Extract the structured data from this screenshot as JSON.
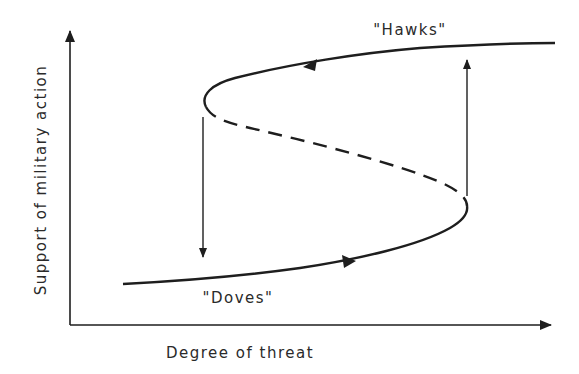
{
  "diagram": {
    "type": "catastrophe-fold-hysteresis",
    "x_axis_label": "Degree of threat",
    "y_axis_label": "Support of military action",
    "upper_branch_label": "\"Hawks\"",
    "lower_branch_label": "\"Doves\"",
    "colors": {
      "line": "#1e1e1e",
      "background": "#ffffff"
    },
    "branches": [
      {
        "name": "upper-stable",
        "style": "solid",
        "direction": "left"
      },
      {
        "name": "middle-unstable",
        "style": "dashed"
      },
      {
        "name": "lower-stable",
        "style": "solid",
        "direction": "right"
      }
    ],
    "jumps": [
      {
        "name": "jump-down",
        "from": "upper fold",
        "to": "lower branch"
      },
      {
        "name": "jump-up",
        "from": "lower fold",
        "to": "upper branch"
      }
    ]
  }
}
